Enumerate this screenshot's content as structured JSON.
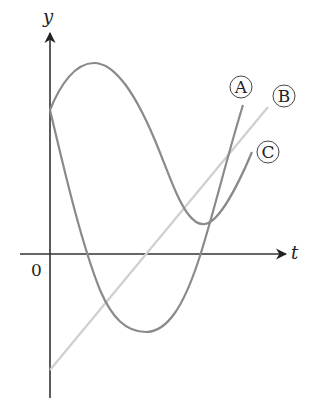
{
  "diagram": {
    "axes": {
      "x_label": "t",
      "y_label": "y",
      "origin_label": "0",
      "axis_color": "#333333"
    },
    "curves": [
      {
        "id": "A",
        "label": "A",
        "description": "sine-like curve starting at y-intercept, rising to a maximum, falling to a minimum below t-axis, then rising steeply",
        "color": "#888888"
      },
      {
        "id": "B",
        "label": "B",
        "description": "straight line with positive slope starting below origin",
        "color": "#cccccc"
      },
      {
        "id": "C",
        "label": "C",
        "description": "cosine-like curve starting at y-intercept, falling to a minimum above the t-axis, then rising",
        "color": "#888888"
      }
    ]
  }
}
